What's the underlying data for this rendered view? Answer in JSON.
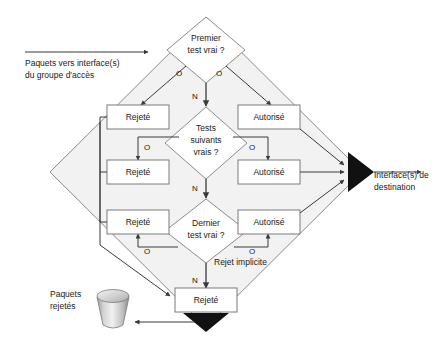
{
  "diagram": {
    "colors": {
      "diamond_fill": "#f2f2f2",
      "diamond_stroke": "#8c8c8c",
      "box_fill": "#ffffff",
      "box_stroke": "#7a7a7a",
      "line": "#3a3a3a",
      "text": "#1a1a1a",
      "merge_triangle": "#111111",
      "bin_light": "#e8e8e8",
      "bin_dark": "#9a9a9a"
    },
    "inputs": [
      {
        "name": "packets-in",
        "line1": "Paquets vers interface(s)",
        "line2": "du groupe d'accès"
      }
    ],
    "outputs": [
      {
        "name": "destination-interfaces",
        "line1": "Interface(s) de",
        "line2": "destination"
      },
      {
        "name": "rejected-packets",
        "line1": "Paquets",
        "line2": "rejetés"
      }
    ],
    "decisions": [
      {
        "id": "first-test",
        "line1": "Premier",
        "line2": "test vrai ?",
        "yes_label": "O",
        "no_label": "N"
      },
      {
        "id": "next-tests",
        "line1": "Tests",
        "line2": "suivants",
        "line3": "vrais ?",
        "yes_label": "O",
        "no_label": "N"
      },
      {
        "id": "last-test",
        "line1": "Dernier",
        "line2": "test vrai ?",
        "yes_label": "O",
        "no_label": "N"
      }
    ],
    "reject_boxes": [
      {
        "id": "reject-1",
        "label": "Rejeté"
      },
      {
        "id": "reject-2",
        "label": "Rejeté"
      },
      {
        "id": "reject-3",
        "label": "Rejeté"
      },
      {
        "id": "reject-final",
        "label": "Rejeté"
      }
    ],
    "allow_boxes": [
      {
        "id": "allow-1",
        "label": "Autorisé"
      },
      {
        "id": "allow-2",
        "label": "Autorisé"
      },
      {
        "id": "allow-3",
        "label": "Autorisé"
      }
    ],
    "annotations": [
      {
        "id": "implicit-deny",
        "label": "Rejet implicite"
      }
    ],
    "branch_labels": {
      "yes": "O",
      "no": "N"
    }
  }
}
